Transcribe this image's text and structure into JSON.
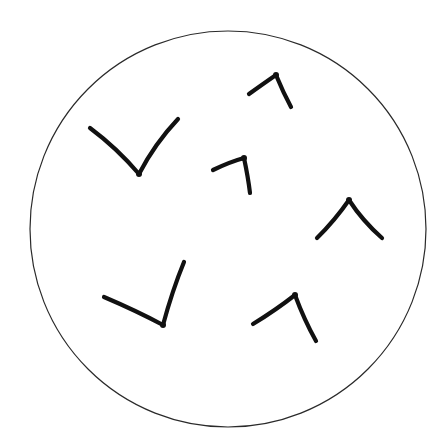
{
  "diagram": {
    "background_color": "#ffffff",
    "boundary": {
      "shape": "circle",
      "cx": 228,
      "cy": 229,
      "r": 198,
      "stroke_color": "#2a2a2a"
    },
    "stroke_color": "#111111",
    "glyphs": [
      {
        "id": "v-upper-left",
        "kind": "open-up-angle",
        "points": [
          [
            90,
            128
          ],
          [
            139,
            174
          ],
          [
            178,
            119
          ]
        ]
      },
      {
        "id": "hook-top",
        "kind": "open-down-angle",
        "points": [
          [
            249,
            94
          ],
          [
            276,
            75
          ],
          [
            291,
            107
          ]
        ]
      },
      {
        "id": "hook-middle",
        "kind": "open-down-angle",
        "points": [
          [
            213,
            170
          ],
          [
            244,
            158
          ],
          [
            250,
            193
          ]
        ]
      },
      {
        "id": "caret-right",
        "kind": "open-down-angle",
        "points": [
          [
            317,
            238
          ],
          [
            349,
            200
          ],
          [
            382,
            238
          ]
        ]
      },
      {
        "id": "check-lower-left",
        "kind": "open-up-angle",
        "points": [
          [
            104,
            297
          ],
          [
            163,
            325
          ],
          [
            184,
            262
          ]
        ]
      },
      {
        "id": "hook-lower-right",
        "kind": "open-down-angle",
        "points": [
          [
            253,
            324
          ],
          [
            295,
            295
          ],
          [
            316,
            341
          ]
        ]
      }
    ]
  }
}
